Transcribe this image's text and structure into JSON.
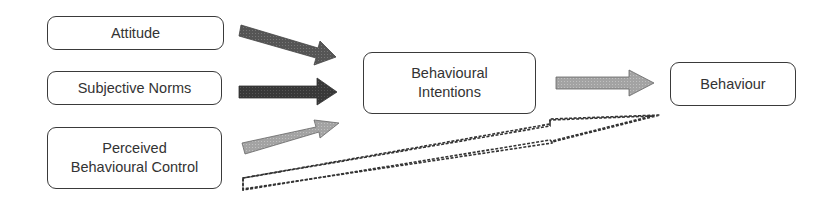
{
  "diagram": {
    "nodes": [
      {
        "id": "attitude",
        "label": "Attitude"
      },
      {
        "id": "subjective_norms",
        "label": "Subjective Norms"
      },
      {
        "id": "pbc",
        "label_line1": "Perceived",
        "label_line2": "Behavioural Control"
      },
      {
        "id": "intentions",
        "label_line1": "Behavioural",
        "label_line2": "Intentions"
      },
      {
        "id": "behaviour",
        "label": "Behaviour"
      }
    ],
    "edges": [
      {
        "from": "attitude",
        "to": "intentions",
        "style": "solid",
        "color": "#5a5a5a"
      },
      {
        "from": "subjective_norms",
        "to": "intentions",
        "style": "solid",
        "color": "#3a3a3a"
      },
      {
        "from": "pbc",
        "to": "intentions",
        "style": "solid",
        "color": "#a0a0a0"
      },
      {
        "from": "intentions",
        "to": "behaviour",
        "style": "solid",
        "color": "#a8a8a8"
      },
      {
        "from": "pbc",
        "to": "behaviour",
        "style": "dashed-outline",
        "color": "#333333"
      }
    ]
  }
}
